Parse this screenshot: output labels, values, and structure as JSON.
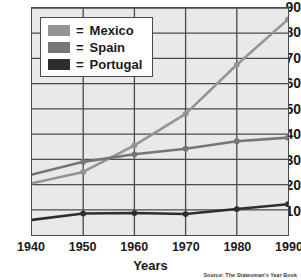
{
  "chart_data": {
    "type": "line",
    "title": "",
    "xlabel": "Years",
    "ylabel": "",
    "categories": [
      1940,
      1950,
      1960,
      1970,
      1980,
      1990
    ],
    "x": [
      1940,
      1950,
      1960,
      1970,
      1980,
      1990
    ],
    "xlim": [
      1940,
      1990
    ],
    "ylim": [
      0,
      90
    ],
    "grid": true,
    "legend_position": "top-left",
    "ytick_labels": [
      "90",
      "80",
      "70",
      "60",
      "50",
      "40",
      "30",
      "20",
      "10"
    ],
    "ytick_values": [
      90,
      80,
      70,
      60,
      50,
      40,
      30,
      20,
      10
    ],
    "xtick_labels": [
      "1940",
      "1950",
      "1960",
      "1970",
      "1980",
      "1990"
    ],
    "series": [
      {
        "name": "Mexico",
        "color": "#949494",
        "marker": "circle",
        "values": [
          20.5,
          25.0,
          35.5,
          48.0,
          67.5,
          85.5
        ]
      },
      {
        "name": "Spain",
        "color": "#767676",
        "marker": "circle",
        "values": [
          24.0,
          29.0,
          32.0,
          34.2,
          37.2,
          38.6
        ]
      },
      {
        "name": "Portugal",
        "color": "#2e2e2e",
        "marker": "circle",
        "values": [
          6.0,
          8.5,
          8.7,
          8.3,
          10.3,
          12.2
        ]
      }
    ],
    "annotations": [
      "Source: The Statesman's Year Book"
    ],
    "source_note": "Source: The Statesman's Year Book"
  },
  "legend": {
    "equals_sign": "=",
    "entries": [
      {
        "label": "Mexico",
        "swatch_color": "#949494"
      },
      {
        "label": "Spain",
        "swatch_color": "#767676"
      },
      {
        "label": "Portugal",
        "swatch_color": "#2e2e2e"
      }
    ]
  },
  "axes": {
    "x_title": "Years"
  },
  "style": {
    "plot_background": "#e9e9e9",
    "grid_color": "#4a4a4a",
    "axis_color": "#4a4a4a",
    "page_background": "#ffffff",
    "text_color": "#1a1a1a"
  }
}
